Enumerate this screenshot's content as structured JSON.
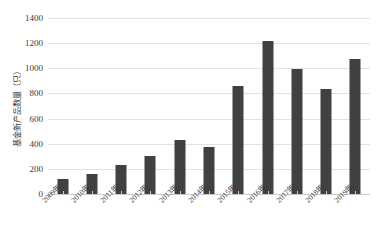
{
  "chart_data": {
    "type": "bar",
    "title": "",
    "subtitle": "",
    "xlabel": "",
    "ylabel": "基金新产品数量（只）",
    "categories": [
      "2009年",
      "2010年",
      "2011年",
      "2012年",
      "2013年",
      "2014年",
      "2015年",
      "2016年",
      "2017年",
      "2018年",
      "2019年"
    ],
    "values": [
      120,
      160,
      230,
      300,
      430,
      375,
      860,
      1220,
      995,
      835,
      1075
    ],
    "series": [
      {
        "name": "基金新产品数量（只）",
        "values": [
          120,
          160,
          230,
          300,
          430,
          375,
          860,
          1220,
          995,
          835,
          1075
        ]
      }
    ],
    "ylim": [
      0,
      1400
    ],
    "ytick_values": [
      0,
      200,
      400,
      600,
      800,
      1000,
      1200,
      1400
    ],
    "ytick_labels": [
      "0",
      "200",
      "400",
      "600",
      "800",
      "1000",
      "1200",
      "1400"
    ],
    "grid": true,
    "grid_axis": "y",
    "legend": false,
    "legend_position": "none",
    "bar_color": "#404040",
    "gridline_color": "#e2e2e2",
    "axis_color": "#c9c9c9",
    "background_color": "#ffffff",
    "xtick_label_rotation": -45
  }
}
